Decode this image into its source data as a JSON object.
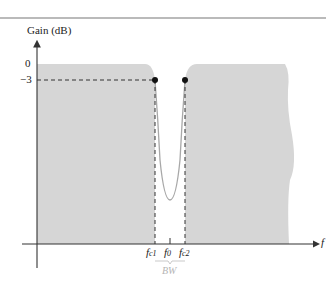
{
  "diagram": {
    "type": "band-stop filter frequency response",
    "y_axis_label": "Gain (dB)",
    "y_ticks": [
      {
        "label": "0",
        "value_db": 0
      },
      {
        "label": "−3",
        "value_db": -3
      }
    ],
    "x_axis_label": "f",
    "x_ticks": [
      {
        "base": "f",
        "sub": "c1",
        "name": "lower-cutoff"
      },
      {
        "base": "f",
        "sub": "0",
        "name": "center-frequency"
      },
      {
        "base": "f",
        "sub": "c2",
        "name": "upper-cutoff"
      }
    ],
    "bandwidth_label": "BW",
    "colors": {
      "fill": "#d6d6d6",
      "axis": "#333333",
      "curve": "#a8a8a8",
      "dashed": "#333333",
      "bw_label": "#b4b4b4",
      "top_rule": "#777777"
    }
  }
}
